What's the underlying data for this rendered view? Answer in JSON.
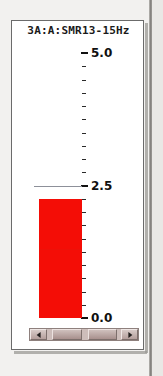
{
  "panel": {
    "title": "3A:A:SMR13-15Hz",
    "background_color": "#ffffff",
    "border_color": "#6b6b6b"
  },
  "scrollbar": {
    "left_arrow_icon": "triangle-left-icon",
    "right_arrow_icon": "triangle-right-icon",
    "thumb_a_label": "",
    "thumb_b_label": ""
  },
  "chart_data": {
    "type": "bar",
    "title": "3A:A:SMR13-15Hz",
    "orientation": "vertical",
    "categories": [
      "SMR13-15Hz"
    ],
    "values": [
      2.25
    ],
    "series": [
      {
        "name": "SMR13-15Hz",
        "values": [
          2.25
        ],
        "color": "#f40d06"
      }
    ],
    "ylim": [
      0.0,
      5.0
    ],
    "ylabel": "",
    "xlabel": "",
    "grid": false,
    "legend": false,
    "y_tick_labels": [
      "0.0",
      "2.5",
      "5.0"
    ],
    "y_tick_values": [
      0.0,
      2.5,
      5.0
    ],
    "minor_tick_step": 0.25,
    "annotations": [
      {
        "name": "threshold",
        "value": 2.5,
        "color": "#8d9099",
        "style": "horizontal-line"
      }
    ]
  }
}
